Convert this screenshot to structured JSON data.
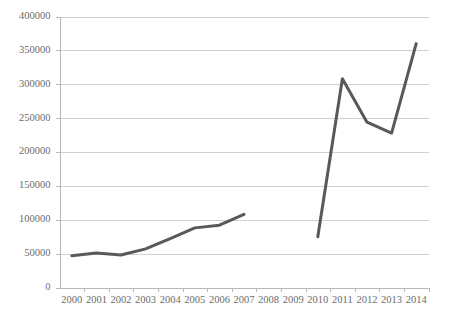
{
  "chart_data": {
    "type": "line",
    "title": "",
    "subtitle": "",
    "xlabel": "",
    "ylabel": "",
    "grid": true,
    "legend": "none",
    "xlim": [
      2000,
      2014
    ],
    "ylim": [
      0,
      400000
    ],
    "ytick_step": 50000,
    "x": [
      2000,
      2001,
      2002,
      2003,
      2004,
      2005,
      2006,
      2007,
      2008,
      2009,
      2010,
      2011,
      2012,
      2013,
      2014
    ],
    "categories": [
      "2000",
      "2001",
      "2002",
      "2003",
      "2004",
      "2005",
      "2006",
      "2007",
      "2008",
      "2009",
      "2010",
      "2011",
      "2012",
      "2013",
      "2014"
    ],
    "ytick_labels": [
      "0",
      "50000",
      "100000",
      "150000",
      "200000",
      "250000",
      "300000",
      "350000",
      "400000"
    ],
    "ytick_values": [
      0,
      50000,
      100000,
      150000,
      200000,
      250000,
      300000,
      350000,
      400000
    ],
    "series": [
      {
        "name": "segment-2000-2007",
        "color": "#595959",
        "x": [
          2000,
          2001,
          2002,
          2003,
          2004,
          2005,
          2006,
          2007
        ],
        "values": [
          47000,
          51000,
          48000,
          57000,
          72000,
          88000,
          92000,
          108000
        ]
      },
      {
        "name": "segment-2010-2014",
        "color": "#595959",
        "x": [
          2010,
          2011,
          2012,
          2013,
          2014
        ],
        "values": [
          75000,
          308000,
          244000,
          228000,
          360000
        ]
      }
    ],
    "gap_years": [
      2008,
      2009
    ],
    "line_color": "#595959",
    "gridline_color": "#d0d0d0",
    "axis_color": "#b8b8b8",
    "tick_label_color": "#6b6b6b",
    "background_color": "#ffffff"
  }
}
